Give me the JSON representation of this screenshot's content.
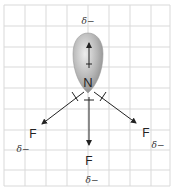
{
  "diagram": {
    "grid": {
      "x_lines": [
        4,
        25,
        46,
        67,
        88,
        109,
        130,
        151,
        170
      ],
      "y_lines": [
        5,
        26,
        47,
        67,
        88,
        109,
        130,
        150,
        170,
        186
      ],
      "color": "#d9d9d9"
    },
    "central_atom": {
      "label": "N",
      "x": 88,
      "y": 87
    },
    "lone_pair_charge": {
      "label": "δ−",
      "x": 88,
      "y": 24
    },
    "fluorines": [
      {
        "label": "F",
        "x": 33,
        "y": 135,
        "charge": "δ−",
        "charge_x": 21,
        "charge_y": 149
      },
      {
        "label": "F",
        "x": 89,
        "y": 161,
        "charge": "δ−",
        "charge_x": 93,
        "charge_y": 180
      },
      {
        "label": "F",
        "x": 146,
        "y": 134,
        "charge": "δ−",
        "charge_x": 158,
        "charge_y": 146
      }
    ],
    "colors": {
      "lobe_light": "#e6e6e6",
      "lobe_dark": "#8c8c8c",
      "arrow": "#222222",
      "grid": "#d9d9d9"
    }
  }
}
